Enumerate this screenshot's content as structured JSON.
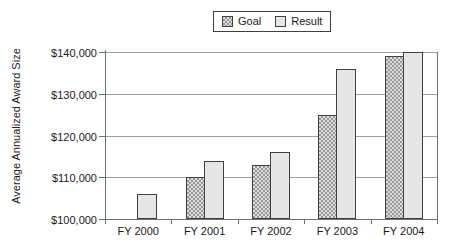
{
  "chart_data": {
    "type": "bar",
    "title": "",
    "ylabel": "Average Annualized Award Size",
    "categories": [
      "FY 2000",
      "FY 2001",
      "FY 2002",
      "FY 2003",
      "FY 2004"
    ],
    "series": [
      {
        "name": "Goal",
        "values": [
          null,
          110000,
          113000,
          125000,
          139000
        ]
      },
      {
        "name": "Result",
        "values": [
          106000,
          114000,
          116000,
          136000,
          140000
        ]
      }
    ],
    "ylim": [
      100000,
      140000
    ],
    "yticks": [
      100000,
      110000,
      120000,
      130000,
      140000
    ],
    "ytick_labels": [
      "$100,000",
      "$110,000",
      "$120,000",
      "$130,000",
      "$140,000"
    ],
    "grid": true,
    "legend_position": "top-center",
    "colors": {
      "goal_pattern_dot": "#989898",
      "goal_pattern_bg": "#dcdcdc",
      "result_fill": "#e6e6e6",
      "bar_border": "#404040",
      "axis": "#707070",
      "gridline": "#a0a0a0",
      "text": "#1a1a1a"
    }
  }
}
